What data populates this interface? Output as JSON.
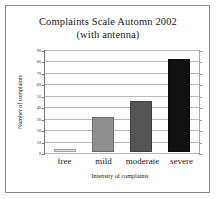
{
  "chart_data": {
    "type": "bar",
    "title": "Complaints Scale Automn 2002",
    "subtitle": "(with antenna)",
    "categories": [
      "free",
      "mild",
      "moderate",
      "severe"
    ],
    "values": [
      3,
      31,
      45,
      82
    ],
    "series": [
      {
        "name": "Number of complaints",
        "values": [
          3,
          31,
          45,
          82
        ]
      }
    ],
    "xlabel": "Intensity of complaints",
    "ylabel": "Number of complaints",
    "ylim": [
      0,
      90
    ],
    "ytick_labels": [
      "90",
      "80",
      "70",
      "60",
      "50",
      "40",
      "30",
      "20",
      "10",
      "0"
    ],
    "ytick_values": [
      90,
      80,
      70,
      60,
      50,
      40,
      30,
      20,
      10,
      0
    ],
    "grid": true,
    "legend": false,
    "bar_colors": [
      "#d9d9d9",
      "#8f8f8f",
      "#545454",
      "#111111"
    ],
    "frame_color": "#8a8a8a",
    "gridline_color": "#b9b9b9",
    "axis_color": "#777777",
    "background": "#ffffff"
  }
}
